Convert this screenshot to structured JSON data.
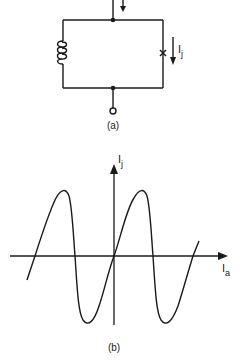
{
  "figure_a": {
    "caption": "(a)",
    "current_label_main": "I",
    "current_label_sub": "j",
    "components": [
      "inductor",
      "josephson-junction"
    ]
  },
  "figure_b": {
    "caption": "(b)",
    "y_axis_label_main": "I",
    "y_axis_label_sub": "j",
    "x_axis_label_main": "I",
    "x_axis_label_sub": "a"
  },
  "colors": {
    "ink": "#1a1a1a",
    "background": "#ffffff"
  }
}
